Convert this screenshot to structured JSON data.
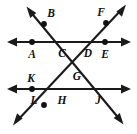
{
  "figure": {
    "canvas": {
      "width": 137,
      "height": 134,
      "background": "#ffffff"
    },
    "stroke_color": "#1a1a1a",
    "point_color": "#111111",
    "label_color": "#111111",
    "labels": [
      {
        "id": "label-a",
        "text": "A",
        "x": 32,
        "y": 55
      },
      {
        "id": "label-b",
        "text": "B",
        "x": 51,
        "y": 14
      },
      {
        "id": "label-c",
        "text": "C",
        "x": 62,
        "y": 54
      },
      {
        "id": "label-d",
        "text": "D",
        "x": 88,
        "y": 54
      },
      {
        "id": "label-e",
        "text": "E",
        "x": 105,
        "y": 55
      },
      {
        "id": "label-f",
        "text": "F",
        "x": 101,
        "y": 13
      },
      {
        "id": "label-g",
        "text": "G",
        "x": 77,
        "y": 77
      },
      {
        "id": "label-h",
        "text": "H",
        "x": 62,
        "y": 101
      },
      {
        "id": "label-j",
        "text": "J",
        "x": 98,
        "y": 101
      },
      {
        "id": "label-k",
        "text": "K",
        "x": 31,
        "y": 79
      },
      {
        "id": "label-l",
        "text": "L",
        "x": 34,
        "y": 101
      }
    ],
    "points": [
      {
        "id": "point-a",
        "label": "A",
        "x": 32,
        "y": 42,
        "r": 2.9
      },
      {
        "id": "point-b",
        "label": "B",
        "x": 44,
        "y": 24,
        "r": 2.9
      },
      {
        "id": "point-e",
        "label": "E",
        "x": 105,
        "y": 42,
        "r": 2.9
      },
      {
        "id": "point-f",
        "label": "F",
        "x": 106,
        "y": 23,
        "r": 2.9
      },
      {
        "id": "point-k",
        "label": "K",
        "x": 32,
        "y": 89,
        "r": 2.9
      },
      {
        "id": "point-l",
        "label": "L",
        "x": 44,
        "y": 105,
        "r": 2.9
      }
    ],
    "lines": [
      {
        "id": "line-upper-horizontal",
        "name": "upper-parallel-line",
        "x1": 10,
        "y1": 42,
        "x2": 128,
        "y2": 42,
        "arrows": "both"
      },
      {
        "id": "line-lower-horizontal",
        "name": "lower-parallel-line",
        "x1": 10,
        "y1": 89,
        "x2": 128,
        "y2": 89,
        "arrows": "both"
      },
      {
        "id": "line-transversal-bj",
        "name": "transversal-through-b-c-g-j",
        "x1": 29,
        "y1": 10,
        "x2": 121,
        "y2": 121,
        "arrows": "both"
      },
      {
        "id": "line-transversal-fl",
        "name": "transversal-through-f-d-g-h-l",
        "x1": 123,
        "y1": 8,
        "x2": 16,
        "y2": 122,
        "arrows": "both"
      }
    ],
    "intersections": [
      {
        "id": "intersection-c",
        "label": "C",
        "x": 68,
        "y": 42
      },
      {
        "id": "intersection-d",
        "label": "D",
        "x": 90,
        "y": 42
      },
      {
        "id": "intersection-g",
        "label": "G",
        "x": 78,
        "y": 66
      },
      {
        "id": "intersection-h",
        "label": "H",
        "x": 65,
        "y": 89
      },
      {
        "id": "intersection-j",
        "label": "J",
        "x": 96,
        "y": 89
      }
    ]
  }
}
